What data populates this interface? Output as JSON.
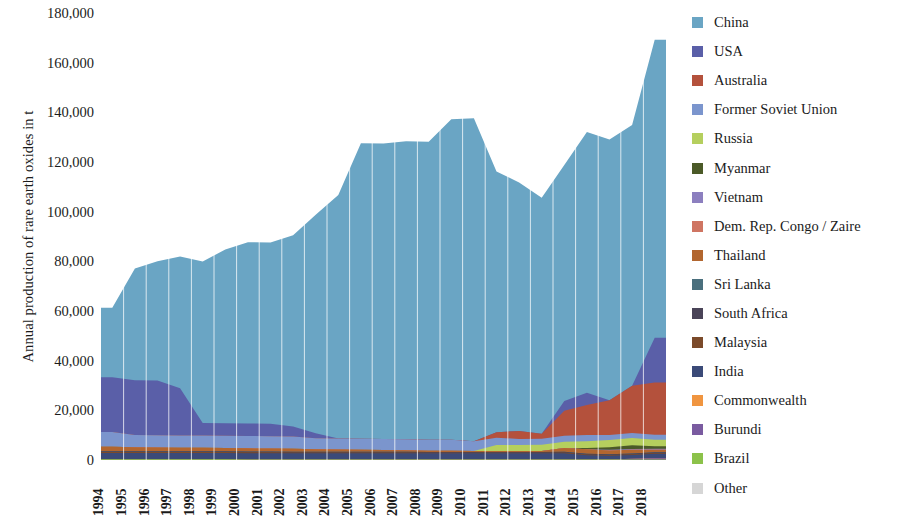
{
  "chart_data": {
    "type": "area",
    "stacked": true,
    "title": "",
    "subtitle": "",
    "xlabel": "",
    "ylabel": "Annual production of rare earth oxides in t",
    "ylim": [
      0,
      180000
    ],
    "ytick_step": 20000,
    "ytick_labels": [
      "180,000",
      "160,000",
      "140,000",
      "120,000",
      "100,000",
      "80,000",
      "60,000",
      "40,000",
      "20,000",
      "0"
    ],
    "ytick_values": [
      180000,
      160000,
      140000,
      120000,
      100000,
      80000,
      60000,
      40000,
      20000,
      0
    ],
    "grid": "vertical",
    "legend_position": "right",
    "categories": [
      "1994",
      "1995",
      "1996",
      "1997",
      "1998",
      "1999",
      "2000",
      "2001",
      "2002",
      "2003",
      "2004",
      "2005",
      "2006",
      "2007",
      "2008",
      "2009",
      "2010",
      "2011",
      "2012",
      "2013",
      "2014",
      "2015",
      "2016",
      "2017",
      "2018"
    ],
    "series": [
      {
        "name": "China",
        "color": "#6aa5c4",
        "values": [
          28000,
          45000,
          48000,
          53000,
          65000,
          70000,
          73000,
          73000,
          77000,
          88000,
          98000,
          119000,
          119000,
          120000,
          120000,
          129000,
          130000,
          105000,
          100000,
          95000,
          95000,
          105000,
          105000,
          105000,
          120000
        ]
      },
      {
        "name": "USA",
        "color": "#5a5fa8",
        "values": [
          22000,
          22000,
          22000,
          19000,
          5000,
          5000,
          5000,
          5000,
          4000,
          2000,
          0,
          0,
          0,
          0,
          0,
          0,
          0,
          0,
          0,
          0,
          4000,
          5000,
          0,
          0,
          18000
        ]
      },
      {
        "name": "Australia",
        "color": "#b4513c",
        "values": [
          0,
          0,
          0,
          0,
          0,
          0,
          0,
          0,
          0,
          0,
          0,
          0,
          0,
          0,
          0,
          0,
          0,
          2200,
          3200,
          2000,
          10000,
          12000,
          14000,
          19000,
          21000
        ]
      },
      {
        "name": "Former Soviet Union",
        "color": "#7b95cd",
        "values": [
          6000,
          5000,
          5000,
          5000,
          5000,
          5000,
          5000,
          5000,
          5000,
          4500,
          4500,
          4500,
          4500,
          4500,
          4500,
          4500,
          4000,
          3000,
          2500,
          2500,
          2500,
          2500,
          2000,
          2000,
          2000
        ]
      },
      {
        "name": "Russia",
        "color": "#b5cf5e",
        "values": [
          0,
          0,
          0,
          0,
          0,
          0,
          0,
          0,
          0,
          0,
          0,
          0,
          0,
          0,
          0,
          0,
          0,
          2400,
          2400,
          2500,
          2500,
          2800,
          3000,
          3000,
          2700
        ]
      },
      {
        "name": "Myanmar",
        "color": "#4b5a28",
        "values": [
          0,
          0,
          0,
          0,
          0,
          0,
          0,
          0,
          0,
          0,
          0,
          0,
          0,
          0,
          0,
          0,
          0,
          0,
          0,
          0,
          0,
          500,
          1000,
          1500,
          1000
        ]
      },
      {
        "name": "Vietnam",
        "color": "#8c7fbf",
        "values": [
          0,
          0,
          0,
          0,
          0,
          0,
          0,
          0,
          0,
          0,
          0,
          0,
          0,
          0,
          0,
          0,
          0,
          0,
          0,
          0,
          0,
          0,
          300,
          300,
          400
        ]
      },
      {
        "name": "Dem. Rep. Congo / Zaire",
        "color": "#cf7562",
        "values": [
          0,
          0,
          0,
          0,
          0,
          0,
          0,
          0,
          0,
          0,
          0,
          0,
          0,
          0,
          0,
          0,
          0,
          0,
          0,
          0,
          0,
          0,
          0,
          0,
          0
        ]
      },
      {
        "name": "Thailand",
        "color": "#b2662f",
        "values": [
          1800,
          1600,
          1500,
          1400,
          1400,
          1300,
          1300,
          1200,
          1200,
          1000,
          900,
          800,
          700,
          600,
          500,
          500,
          400,
          400,
          400,
          400,
          1500,
          1800,
          1500,
          1500,
          1000
        ]
      },
      {
        "name": "Sri Lanka",
        "color": "#4a6f7d",
        "values": [
          0,
          0,
          0,
          0,
          0,
          0,
          0,
          0,
          0,
          0,
          0,
          0,
          0,
          0,
          0,
          0,
          0,
          0,
          0,
          0,
          0,
          0,
          0,
          0,
          0
        ]
      },
      {
        "name": "South Africa",
        "color": "#4a4458",
        "values": [
          300,
          300,
          300,
          300,
          300,
          300,
          300,
          300,
          300,
          300,
          300,
          300,
          300,
          300,
          300,
          300,
          300,
          300,
          300,
          300,
          300,
          300,
          300,
          300,
          300
        ]
      },
      {
        "name": "Malaysia",
        "color": "#7b4a2a",
        "values": [
          400,
          400,
          400,
          400,
          400,
          400,
          400,
          400,
          300,
          300,
          300,
          300,
          300,
          300,
          200,
          200,
          200,
          200,
          200,
          200,
          300,
          300,
          300,
          300,
          300
        ]
      },
      {
        "name": "India",
        "color": "#3b4a78",
        "values": [
          2500,
          2500,
          2500,
          2500,
          2500,
          2500,
          2500,
          2500,
          2500,
          2500,
          2500,
          2500,
          2500,
          2500,
          2500,
          2500,
          2500,
          2500,
          2500,
          2500,
          2500,
          1700,
          1500,
          1500,
          1800
        ]
      },
      {
        "name": "Commonwealth",
        "color": "#f09540",
        "values": [
          0,
          0,
          0,
          0,
          0,
          0,
          0,
          0,
          0,
          0,
          0,
          0,
          0,
          0,
          0,
          0,
          0,
          0,
          0,
          0,
          0,
          0,
          0,
          0,
          0
        ]
      },
      {
        "name": "Burundi",
        "color": "#7a5ba0",
        "values": [
          0,
          0,
          0,
          0,
          0,
          0,
          0,
          0,
          0,
          0,
          0,
          0,
          0,
          0,
          0,
          0,
          0,
          0,
          0,
          0,
          0,
          0,
          0,
          300,
          500
        ]
      },
      {
        "name": "Brazil",
        "color": "#8cc24a",
        "values": [
          300,
          300,
          300,
          300,
          300,
          300,
          200,
          200,
          200,
          200,
          200,
          200,
          200,
          200,
          200,
          200,
          200,
          200,
          200,
          200,
          200,
          200,
          200,
          200,
          200
        ]
      },
      {
        "name": "Other",
        "color": "#d6d6d6",
        "values": [
          0,
          0,
          0,
          0,
          0,
          0,
          0,
          0,
          0,
          0,
          0,
          0,
          0,
          0,
          0,
          0,
          0,
          0,
          0,
          0,
          0,
          0,
          0,
          0,
          0
        ]
      }
    ],
    "totals": [
      61300,
      77100,
      80000,
      81900,
      79900,
      84800,
      87700,
      87600,
      90500,
      98800,
      106700,
      127600,
      127500,
      128400,
      128200,
      137200,
      137600,
      116200,
      111700,
      105600,
      118800,
      131900,
      127100,
      134600,
      169200
    ]
  },
  "axis": {
    "y_title": "Annual production of rare earth oxides in t"
  },
  "legend": {
    "items": [
      {
        "label": "China",
        "color": "#6aa5c4"
      },
      {
        "label": "USA",
        "color": "#5a5fa8"
      },
      {
        "label": "Australia",
        "color": "#b4513c"
      },
      {
        "label": "Former Soviet Union",
        "color": "#7b95cd"
      },
      {
        "label": "Russia",
        "color": "#b5cf5e"
      },
      {
        "label": "Myanmar",
        "color": "#4b5a28"
      },
      {
        "label": "Vietnam",
        "color": "#8c7fbf"
      },
      {
        "label": "Dem. Rep. Congo / Zaire",
        "color": "#cf7562"
      },
      {
        "label": "Thailand",
        "color": "#b2662f"
      },
      {
        "label": "Sri Lanka",
        "color": "#4a6f7d"
      },
      {
        "label": "South Africa",
        "color": "#4a4458"
      },
      {
        "label": "Malaysia",
        "color": "#7b4a2a"
      },
      {
        "label": "India",
        "color": "#3b4a78"
      },
      {
        "label": "Commonwealth",
        "color": "#f09540"
      },
      {
        "label": "Burundi",
        "color": "#7a5ba0"
      },
      {
        "label": "Brazil",
        "color": "#8cc24a"
      },
      {
        "label": "Other",
        "color": "#d6d6d6"
      }
    ]
  }
}
